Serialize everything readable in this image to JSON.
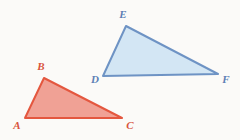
{
  "figure": {
    "type": "geometry-diagram",
    "background_color": "#fbfaf8",
    "width": 240,
    "height": 140
  },
  "shapes": [
    {
      "id": "triangle-abc",
      "name": "Triangle ABC",
      "fill_color": "#f0a195",
      "stroke_color": "#e4573f",
      "label_color": "#d9543c",
      "stroke_width": 2,
      "vertices": [
        {
          "label": "A",
          "x": 25,
          "y": 118,
          "label_x": 17,
          "label_y": 126
        },
        {
          "label": "B",
          "x": 44,
          "y": 78,
          "label_x": 41,
          "label_y": 67
        },
        {
          "label": "C",
          "x": 122,
          "y": 118,
          "label_x": 130,
          "label_y": 126
        }
      ]
    },
    {
      "id": "triangle-def",
      "name": "Triangle DEF",
      "fill_color": "#d3e6f4",
      "stroke_color": "#6e93c4",
      "label_color": "#5b7fb5",
      "stroke_width": 2,
      "vertices": [
        {
          "label": "D",
          "x": 103,
          "y": 76,
          "label_x": 95,
          "label_y": 80
        },
        {
          "label": "E",
          "x": 126,
          "y": 26,
          "label_x": 123,
          "label_y": 15
        },
        {
          "label": "F",
          "x": 218,
          "y": 74,
          "label_x": 226,
          "label_y": 80
        }
      ]
    }
  ]
}
